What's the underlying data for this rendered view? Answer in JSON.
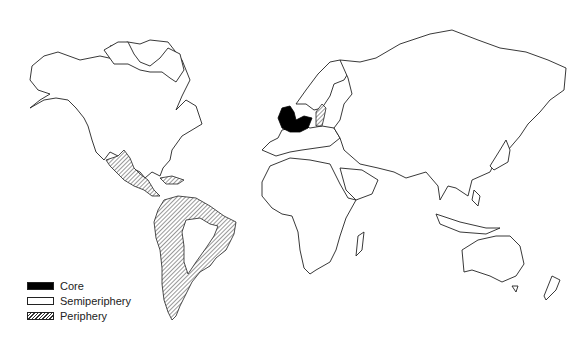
{
  "map": {
    "title": "World-system zones",
    "projection": "world outline map",
    "regions": [
      {
        "name": "Northwestern Europe (England, Netherlands, northern France)",
        "zone": "Core"
      },
      {
        "name": "Mediterranean Europe (Spain, Portugal, Italy)",
        "zone": "Semiperiphery"
      },
      {
        "name": "Eastern Europe / Baltic",
        "zone": "Periphery"
      },
      {
        "name": "Mexico and Central America",
        "zone": "Periphery"
      },
      {
        "name": "Caribbean",
        "zone": "Periphery"
      },
      {
        "name": "South America (coastal ring)",
        "zone": "Periphery"
      }
    ]
  },
  "legend": {
    "items": [
      {
        "label": "Core",
        "pattern": "solid-black",
        "color": "#000000"
      },
      {
        "label": "Semiperiphery",
        "pattern": "white",
        "color": "#ffffff"
      },
      {
        "label": "Periphery",
        "pattern": "diagonal-hatch",
        "color": "#333333"
      }
    ]
  }
}
